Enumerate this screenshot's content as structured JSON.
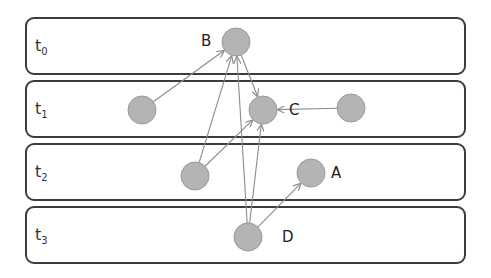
{
  "diagram": {
    "lanes": [
      {
        "id": "t0",
        "base": "t",
        "sub": "0",
        "top": 17
      },
      {
        "id": "t1",
        "base": "t",
        "sub": "1",
        "top": 80
      },
      {
        "id": "t2",
        "base": "t",
        "sub": "2",
        "top": 143
      },
      {
        "id": "t3",
        "base": "t",
        "sub": "3",
        "top": 206
      }
    ],
    "nodes": [
      {
        "id": "B",
        "label": "B",
        "lane": "t0",
        "x": 236,
        "y": 42
      },
      {
        "id": "n1",
        "label": "",
        "lane": "t1",
        "x": 142,
        "y": 110
      },
      {
        "id": "C",
        "label": "C",
        "lane": "t1",
        "x": 263,
        "y": 110
      },
      {
        "id": "n2",
        "label": "",
        "lane": "t1",
        "x": 351,
        "y": 108
      },
      {
        "id": "n3",
        "label": "",
        "lane": "t2",
        "x": 195,
        "y": 176
      },
      {
        "id": "A",
        "label": "A",
        "lane": "t2",
        "x": 311,
        "y": 173
      },
      {
        "id": "D",
        "label": "D",
        "lane": "t3",
        "x": 248,
        "y": 237
      }
    ],
    "edges": [
      {
        "from": "n1",
        "to": "B"
      },
      {
        "from": "B",
        "to": "C"
      },
      {
        "from": "n2",
        "to": "C"
      },
      {
        "from": "n3",
        "to": "B"
      },
      {
        "from": "n3",
        "to": "C"
      },
      {
        "from": "D",
        "to": "B"
      },
      {
        "from": "D",
        "to": "C"
      },
      {
        "from": "D",
        "to": "A"
      }
    ],
    "colors": {
      "node_fill": "#b4b4b4",
      "node_stroke": "#9a9a9a",
      "edge": "#8c8c8c",
      "lane_border": "#3c3c3c"
    }
  }
}
